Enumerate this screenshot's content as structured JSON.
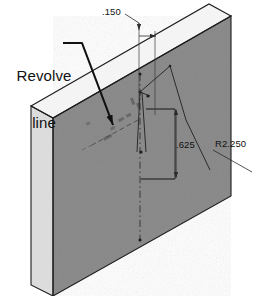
{
  "drawing": {
    "title": "Revolve line isometric part drawing",
    "colors": {
      "front_face": "#8d8d8d",
      "top_face": "#f2f2f2",
      "side_face": "#d9d9d9",
      "outline": "#1a1a1a",
      "dim_line": "#3a3a3a",
      "sketch_line": "#2b2b2b",
      "text": "#111111",
      "background": "#ffffff"
    },
    "annotations": {
      "revolve_line_label": "Revolve\nline",
      "revolve_line_label_line1": "Revolve",
      "revolve_line_label_line2": "line"
    },
    "dimensions": [
      {
        "name": "thickness",
        "value": ".150"
      },
      {
        "name": "height",
        "value": ".625"
      },
      {
        "name": "radius",
        "value": "R2.250"
      }
    ],
    "dim_150": ".150",
    "dim_625": ".625",
    "dim_r2250": "R2.250",
    "icons": {
      "leader_arrow": "leader-arrow-icon",
      "dimension_arrow": "dimension-arrow-icon",
      "centerline": "centerline-dashed-icon"
    }
  }
}
